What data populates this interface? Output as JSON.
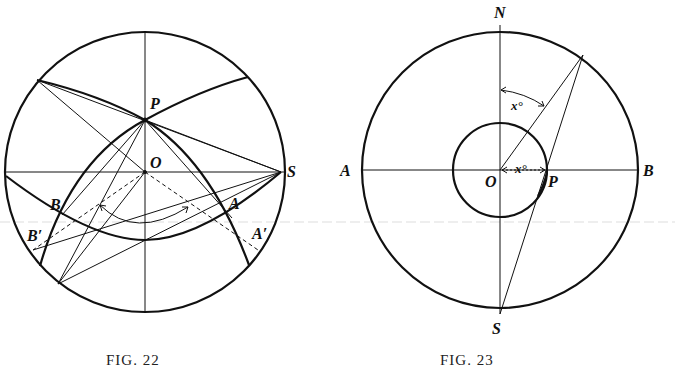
{
  "figures": [
    {
      "id": "fig22",
      "caption": "FIG. 22",
      "labels": {
        "P": "P",
        "O": "O",
        "S": "S",
        "A": "A",
        "B": "B",
        "A_prime": "A′",
        "B_prime": "B′"
      }
    },
    {
      "id": "fig23",
      "caption": "FIG. 23",
      "labels": {
        "N": "N",
        "S": "S",
        "A": "A",
        "B": "B",
        "O": "O",
        "P": "P"
      },
      "angle_labels": {
        "upper": "x°",
        "lower": "x°"
      }
    }
  ]
}
